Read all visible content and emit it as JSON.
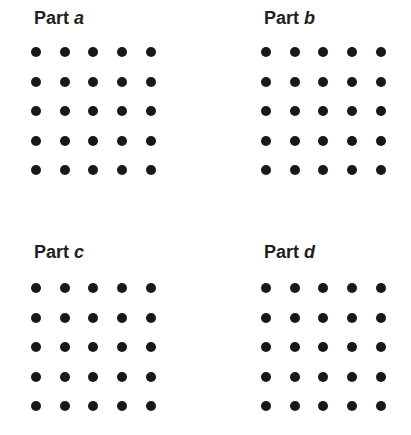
{
  "panels": [
    {
      "id": "a",
      "prefix": "Part",
      "letter": "a",
      "x": 0,
      "y": 0
    },
    {
      "id": "b",
      "prefix": "Part",
      "letter": "b",
      "x": 230,
      "y": 0
    },
    {
      "id": "c",
      "prefix": "Part",
      "letter": "c",
      "x": 0,
      "y": 236
    },
    {
      "id": "d",
      "prefix": "Part",
      "letter": "d",
      "x": 230,
      "y": 236
    }
  ],
  "grid": {
    "rows": 5,
    "cols": 5,
    "dot_color": "#1a1718",
    "dot_diameter": 10,
    "spacing_x": 28.7,
    "spacing_y": 29.5,
    "offset_x": 31,
    "offset_y": 47
  }
}
